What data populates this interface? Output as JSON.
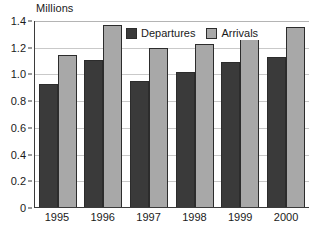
{
  "chart_data": {
    "type": "bar",
    "title": "",
    "subtitle": "",
    "xlabel": "",
    "ylabel": "Millions",
    "categories": [
      "1995",
      "1996",
      "1997",
      "1998",
      "1999",
      "2000"
    ],
    "series": [
      {
        "name": "Departures",
        "color": "#3a3a3a",
        "values": [
          0.92,
          1.1,
          0.94,
          1.01,
          1.085,
          1.12
        ]
      },
      {
        "name": "Arrivals",
        "color": "#a8a8a8",
        "values": [
          1.14,
          1.36,
          1.19,
          1.22,
          1.315,
          1.345
        ]
      }
    ],
    "ylim": [
      0,
      1.4
    ],
    "ytick_values": [
      0,
      0.2,
      0.4,
      0.6,
      0.8,
      1.0,
      1.2,
      1.4
    ],
    "ytick_labels": [
      "0",
      "0.2",
      "0.4",
      "0.6",
      "0.8",
      "1.0",
      "1.2",
      "1.4"
    ],
    "grid": "horizontal",
    "legend_position": "inside-top-center",
    "grid_color": "#c9c9c9",
    "axis_color": "#3b3b3b"
  }
}
